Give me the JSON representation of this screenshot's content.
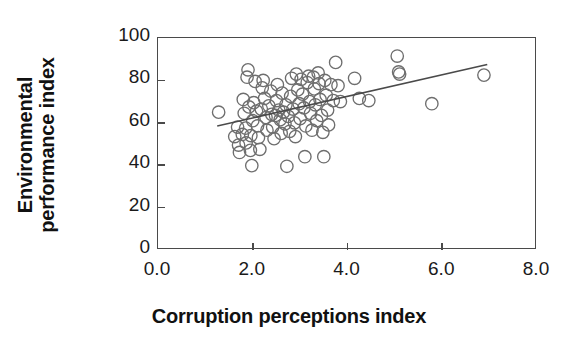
{
  "chart_data": {
    "type": "scatter",
    "title": "",
    "xlabel": "Corruption perceptions index",
    "ylabel_line1": "Environmental",
    "ylabel_line2": "performance index",
    "xlim": [
      0.0,
      8.0
    ],
    "ylim": [
      0,
      100
    ],
    "xticks": [
      0.0,
      2.0,
      4.0,
      6.0,
      8.0
    ],
    "xtick_labels": [
      "0.0",
      "2.0",
      "4.0",
      "6.0",
      "8.0"
    ],
    "yticks": [
      0,
      20,
      40,
      60,
      80,
      100
    ],
    "ytick_labels": [
      "0",
      "20",
      "40",
      "60",
      "80",
      "100"
    ],
    "grid": false,
    "legend": "none",
    "marker": "open-circle",
    "marker_color": "#6e6e6e",
    "marker_radius": 6.2,
    "trendline": {
      "present": true,
      "color": "#4a4a4a",
      "x_start": 1.25,
      "y_start": 58.5,
      "x_end": 6.95,
      "y_end": 87.5
    },
    "points": [
      [
        1.28,
        65.0
      ],
      [
        1.62,
        53.5
      ],
      [
        1.68,
        58.0
      ],
      [
        1.7,
        49.5
      ],
      [
        1.72,
        46.0
      ],
      [
        1.78,
        54.5
      ],
      [
        1.8,
        71.0
      ],
      [
        1.82,
        64.5
      ],
      [
        1.85,
        57.5
      ],
      [
        1.86,
        50.5
      ],
      [
        1.88,
        81.5
      ],
      [
        1.9,
        85.0
      ],
      [
        1.92,
        67.5
      ],
      [
        1.95,
        47.0
      ],
      [
        1.96,
        54.0
      ],
      [
        1.98,
        39.8
      ],
      [
        2.0,
        61.0
      ],
      [
        2.02,
        69.5
      ],
      [
        2.05,
        79.5
      ],
      [
        2.08,
        65.5
      ],
      [
        2.1,
        58.5
      ],
      [
        2.12,
        53.0
      ],
      [
        2.15,
        47.5
      ],
      [
        2.18,
        66.5
      ],
      [
        2.2,
        76.5
      ],
      [
        2.22,
        80.0
      ],
      [
        2.25,
        71.5
      ],
      [
        2.28,
        62.5
      ],
      [
        2.3,
        56.5
      ],
      [
        2.34,
        68.0
      ],
      [
        2.38,
        75.0
      ],
      [
        2.4,
        64.0
      ],
      [
        2.42,
        58.0
      ],
      [
        2.45,
        52.5
      ],
      [
        2.48,
        63.5
      ],
      [
        2.5,
        70.5
      ],
      [
        2.52,
        78.0
      ],
      [
        2.55,
        66.0
      ],
      [
        2.58,
        61.5
      ],
      [
        2.6,
        55.0
      ],
      [
        2.62,
        74.0
      ],
      [
        2.65,
        65.0
      ],
      [
        2.68,
        59.5
      ],
      [
        2.7,
        68.5
      ],
      [
        2.72,
        39.5
      ],
      [
        2.75,
        63.0
      ],
      [
        2.78,
        56.0
      ],
      [
        2.8,
        72.5
      ],
      [
        2.82,
        81.0
      ],
      [
        2.85,
        66.5
      ],
      [
        2.88,
        60.0
      ],
      [
        2.9,
        53.5
      ],
      [
        2.92,
        83.0
      ],
      [
        2.95,
        75.5
      ],
      [
        2.98,
        69.0
      ],
      [
        3.0,
        62.0
      ],
      [
        3.02,
        80.5
      ],
      [
        3.05,
        73.5
      ],
      [
        3.08,
        67.0
      ],
      [
        3.1,
        44.0
      ],
      [
        3.12,
        58.5
      ],
      [
        3.15,
        79.0
      ],
      [
        3.18,
        82.0
      ],
      [
        3.2,
        70.0
      ],
      [
        3.22,
        64.5
      ],
      [
        3.25,
        56.5
      ],
      [
        3.28,
        81.5
      ],
      [
        3.3,
        76.0
      ],
      [
        3.32,
        68.5
      ],
      [
        3.35,
        61.0
      ],
      [
        3.38,
        83.5
      ],
      [
        3.4,
        78.5
      ],
      [
        3.42,
        71.0
      ],
      [
        3.45,
        63.5
      ],
      [
        3.48,
        55.5
      ],
      [
        3.5,
        44.0
      ],
      [
        3.52,
        80.0
      ],
      [
        3.55,
        73.0
      ],
      [
        3.58,
        66.0
      ],
      [
        3.6,
        59.0
      ],
      [
        3.65,
        78.0
      ],
      [
        3.7,
        70.5
      ],
      [
        3.75,
        88.5
      ],
      [
        3.8,
        77.5
      ],
      [
        3.85,
        70.0
      ],
      [
        4.15,
        81.0
      ],
      [
        4.25,
        71.5
      ],
      [
        4.45,
        70.5
      ],
      [
        5.05,
        91.5
      ],
      [
        5.08,
        84.0
      ],
      [
        5.1,
        83.0
      ],
      [
        5.78,
        69.0
      ],
      [
        6.88,
        82.5
      ]
    ]
  }
}
